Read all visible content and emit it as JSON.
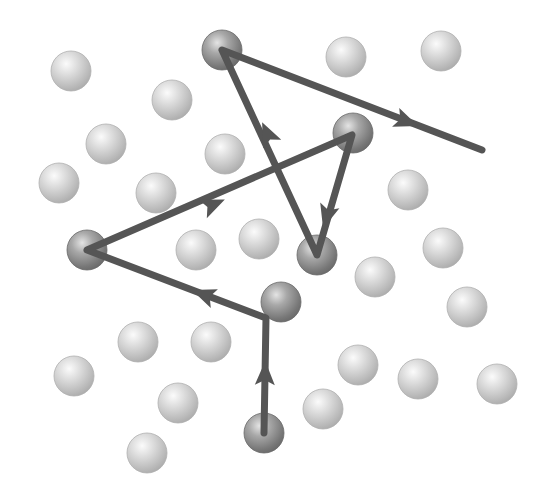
{
  "diagram": {
    "colors": {
      "background": "#ffffff",
      "path": "#555555",
      "molecule_light": "#c8c8c8",
      "particle_dark": "#8a8a8a"
    },
    "sphere_radius": 20,
    "molecules": [
      {
        "x": 71,
        "y": 71
      },
      {
        "x": 172,
        "y": 100
      },
      {
        "x": 106,
        "y": 144
      },
      {
        "x": 59,
        "y": 183
      },
      {
        "x": 156,
        "y": 193
      },
      {
        "x": 225,
        "y": 154
      },
      {
        "x": 346,
        "y": 57
      },
      {
        "x": 441,
        "y": 51
      },
      {
        "x": 408,
        "y": 190
      },
      {
        "x": 196,
        "y": 250
      },
      {
        "x": 259,
        "y": 239
      },
      {
        "x": 443,
        "y": 248
      },
      {
        "x": 375,
        "y": 277
      },
      {
        "x": 467,
        "y": 307
      },
      {
        "x": 138,
        "y": 342
      },
      {
        "x": 211,
        "y": 342
      },
      {
        "x": 74,
        "y": 376
      },
      {
        "x": 178,
        "y": 403
      },
      {
        "x": 147,
        "y": 453
      },
      {
        "x": 358,
        "y": 365
      },
      {
        "x": 418,
        "y": 379
      },
      {
        "x": 497,
        "y": 384
      },
      {
        "x": 323,
        "y": 409
      }
    ],
    "path_points": [
      {
        "x": 264,
        "y": 433
      },
      {
        "x": 266,
        "y": 318
      },
      {
        "x": 87,
        "y": 250
      },
      {
        "x": 352,
        "y": 135
      },
      {
        "x": 317,
        "y": 255
      },
      {
        "x": 222,
        "y": 50
      },
      {
        "x": 482,
        "y": 150
      }
    ],
    "collision_particles": [
      {
        "x": 264,
        "y": 433
      },
      {
        "x": 281,
        "y": 302
      },
      {
        "x": 87,
        "y": 250
      },
      {
        "x": 353,
        "y": 133
      },
      {
        "x": 317,
        "y": 255
      },
      {
        "x": 222,
        "y": 50
      }
    ],
    "arrowheads": [
      {
        "x": 265,
        "y": 375,
        "dir": "up"
      },
      {
        "x": 205,
        "y": 295,
        "dir": "left-up"
      },
      {
        "x": 212,
        "y": 205,
        "dir": "right-up"
      },
      {
        "x": 327,
        "y": 215,
        "dir": "down"
      },
      {
        "x": 268,
        "y": 135,
        "dir": "up-left"
      },
      {
        "x": 405,
        "y": 121,
        "dir": "right-down"
      }
    ]
  }
}
